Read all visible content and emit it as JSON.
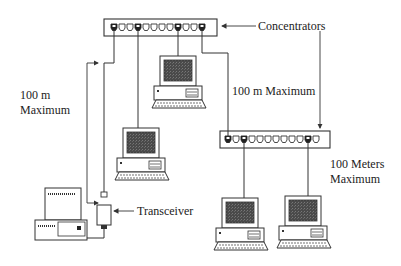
{
  "labels": {
    "concentrators": "Concentrators",
    "left_distance_line1": "100 m",
    "left_distance_line2": "Maximum",
    "middle_distance": "100 m Maximum",
    "right_distance_line1": "100 Meters",
    "right_distance_line2": "Maximum",
    "transceiver": "Transceiver"
  },
  "concentrators": [
    {
      "id": "top",
      "ports": 12,
      "used_ports": [
        0,
        3,
        8,
        11
      ]
    },
    {
      "id": "bottom",
      "ports": 12,
      "used_ports": [
        0,
        2,
        10
      ]
    }
  ],
  "devices": [
    {
      "id": "pc-upper-middle",
      "type": "workstation"
    },
    {
      "id": "pc-left",
      "type": "workstation"
    },
    {
      "id": "pc-transceiver",
      "type": "desktop-with-transceiver"
    },
    {
      "id": "pc-bottom-left",
      "type": "workstation"
    },
    {
      "id": "pc-bottom-right",
      "type": "workstation"
    }
  ],
  "colors": {
    "line": "#333333",
    "screen": "#555555",
    "background": "#ffffff"
  }
}
